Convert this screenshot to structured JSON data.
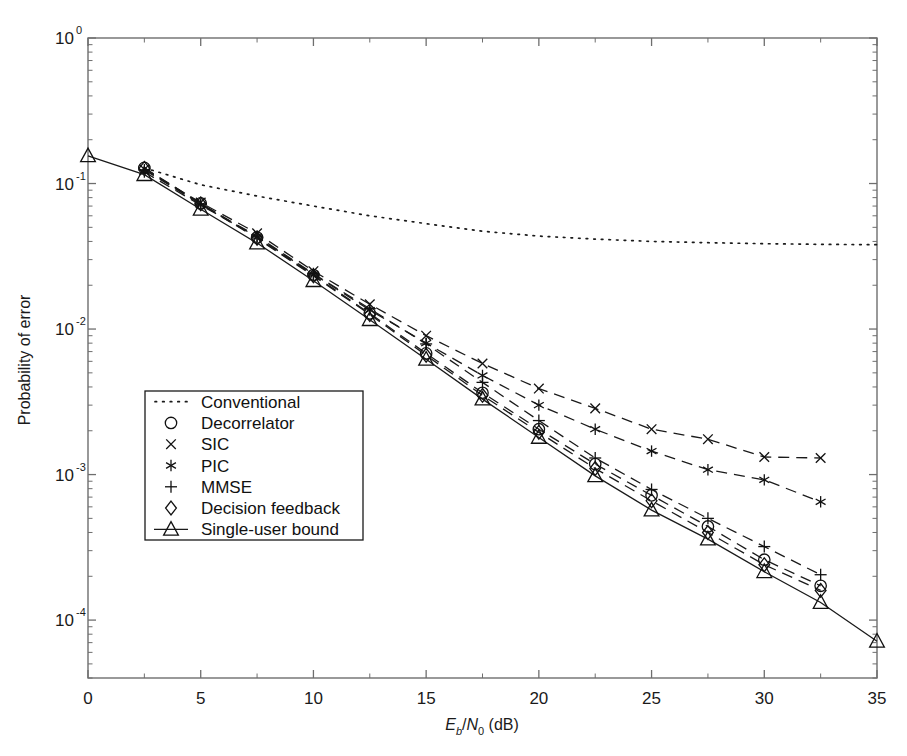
{
  "figure": {
    "background": "#ffffff",
    "axis_color": "#6e6e6e",
    "line_color": "#1a1a1a"
  },
  "chart_data": {
    "type": "line",
    "title": "",
    "xlabel": "E_b/N_0 (dB)",
    "xlabel_parts": {
      "e": "E",
      "b": "b",
      "slash": "/",
      "n": "N",
      "zero": "0",
      "unit": " (dB)"
    },
    "ylabel": "Probability of error",
    "xlim": [
      0,
      35
    ],
    "ylim": [
      4e-05,
      1
    ],
    "yscale": "log",
    "xticks": [
      0,
      5,
      10,
      15,
      20,
      25,
      30,
      35
    ],
    "xticklabels": [
      "0",
      "5",
      "10",
      "15",
      "20",
      "25",
      "30",
      "35"
    ],
    "yticks": [
      1,
      0.1,
      0.01,
      0.001,
      0.0001
    ],
    "yticklabels": [
      "10",
      "10",
      "10",
      "10",
      "10"
    ],
    "ytickexponents": [
      "0",
      "-1",
      "-2",
      "-3",
      "-4"
    ],
    "grid": false,
    "legend_position": "lower left",
    "series": [
      {
        "name": "Conventional",
        "marker": "none",
        "linestyle": "dotted",
        "x": [
          2.5,
          5,
          7.5,
          10,
          12.5,
          15,
          17.5,
          20,
          22.5,
          25,
          27.5,
          30,
          32.5,
          35
        ],
        "y": [
          0.128,
          0.098,
          0.082,
          0.07,
          0.06,
          0.053,
          0.047,
          0.0435,
          0.0415,
          0.04,
          0.0392,
          0.0386,
          0.0382,
          0.038
        ]
      },
      {
        "name": "Decorrelator",
        "marker": "circle",
        "linestyle": "dashed",
        "x": [
          2.5,
          5,
          7.5,
          10,
          12.5,
          15,
          17.5,
          20,
          22.5,
          25,
          27.5,
          30,
          32.5
        ],
        "y": [
          0.128,
          0.073,
          0.0425,
          0.0235,
          0.0128,
          0.0068,
          0.00365,
          0.00205,
          0.00118,
          0.00072,
          0.00044,
          0.00026,
          0.000172
        ]
      },
      {
        "name": "SIC",
        "marker": "cross",
        "linestyle": "dashed",
        "x": [
          2.5,
          5,
          7.5,
          10,
          12.5,
          15,
          17.5,
          20,
          22.5,
          25,
          27.5,
          30,
          32.5
        ],
        "y": [
          0.125,
          0.074,
          0.0455,
          0.025,
          0.0148,
          0.009,
          0.0058,
          0.0039,
          0.00285,
          0.00205,
          0.00175,
          0.00132,
          0.0013
        ]
      },
      {
        "name": "PIC",
        "marker": "asterisk",
        "linestyle": "dashed",
        "x": [
          2.5,
          5,
          7.5,
          10,
          12.5,
          15,
          17.5,
          20,
          22.5,
          25,
          27.5,
          30,
          32.5
        ],
        "y": [
          0.12,
          0.071,
          0.043,
          0.0238,
          0.0135,
          0.008,
          0.0048,
          0.003,
          0.00205,
          0.00145,
          0.00108,
          0.00092,
          0.00065
        ]
      },
      {
        "name": "MMSE",
        "marker": "plus",
        "linestyle": "dashed",
        "x": [
          2.5,
          5,
          7.5,
          10,
          12.5,
          15,
          17.5,
          20,
          22.5,
          25,
          27.5,
          30,
          32.5
        ],
        "y": [
          0.124,
          0.072,
          0.0435,
          0.024,
          0.0138,
          0.0079,
          0.0043,
          0.00235,
          0.0013,
          0.00079,
          0.0005,
          0.00032,
          0.000205
        ]
      },
      {
        "name": "Decision feedback",
        "marker": "diamond",
        "linestyle": "dashed",
        "x": [
          2.5,
          5,
          7.5,
          10,
          12.5,
          15,
          17.5,
          20,
          22.5,
          25,
          27.5,
          30,
          32.5
        ],
        "y": [
          0.127,
          0.0725,
          0.042,
          0.0232,
          0.0126,
          0.0066,
          0.0035,
          0.00195,
          0.0011,
          0.00066,
          0.0004,
          0.00024,
          0.00016
        ]
      },
      {
        "name": "Single-user bound",
        "marker": "triangle",
        "linestyle": "solid",
        "x": [
          0,
          2.5,
          5,
          7.5,
          10,
          12.5,
          15,
          17.5,
          20,
          22.5,
          25,
          27.5,
          30,
          32.5,
          35
        ],
        "y": [
          0.155,
          0.115,
          0.0665,
          0.039,
          0.0215,
          0.0116,
          0.0062,
          0.0033,
          0.0018,
          0.00098,
          0.00057,
          0.00036,
          0.000215,
          0.000132,
          7.15e-05
        ]
      }
    ]
  },
  "legend": {
    "entries": [
      {
        "label": "Conventional",
        "marker": "dots"
      },
      {
        "label": "Decorrelator",
        "marker": "circle"
      },
      {
        "label": "SIC",
        "marker": "cross"
      },
      {
        "label": "PIC",
        "marker": "asterisk"
      },
      {
        "label": "MMSE",
        "marker": "plus"
      },
      {
        "label": "Decision feedback",
        "marker": "diamond"
      },
      {
        "label": "Single-user bound",
        "marker": "triangle-line"
      }
    ]
  }
}
